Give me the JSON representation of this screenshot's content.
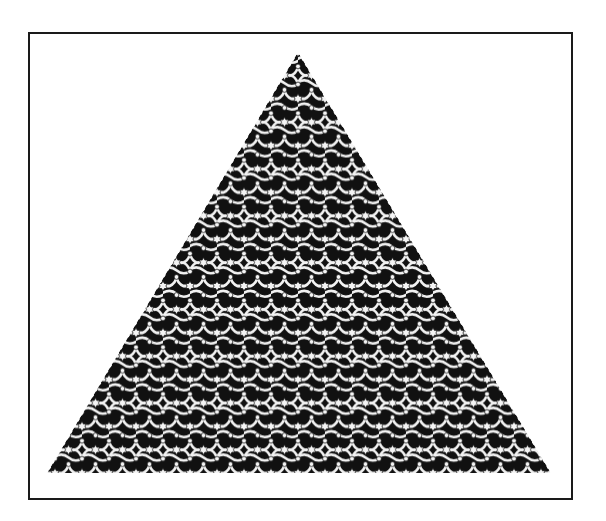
{
  "figure": {
    "frame": {
      "x": 29,
      "y": 33,
      "width": 543,
      "height": 466,
      "stroke": "#1a1a1a",
      "stroke_width": 2
    },
    "triangle": {
      "apex": [
        298,
        52
      ],
      "bottom_left": [
        47,
        473
      ],
      "bottom_right": [
        551,
        473
      ]
    },
    "pattern": {
      "type": "interlaced-bands-star-lattice",
      "period_x": 27,
      "period_y": 46.8,
      "band_color": "#ffffff",
      "outline_color": "#111111",
      "background": "#111111",
      "hole_color": "#f4f4f4"
    },
    "colors": {
      "page_background": "#ffffff",
      "ink": "#111111"
    }
  }
}
